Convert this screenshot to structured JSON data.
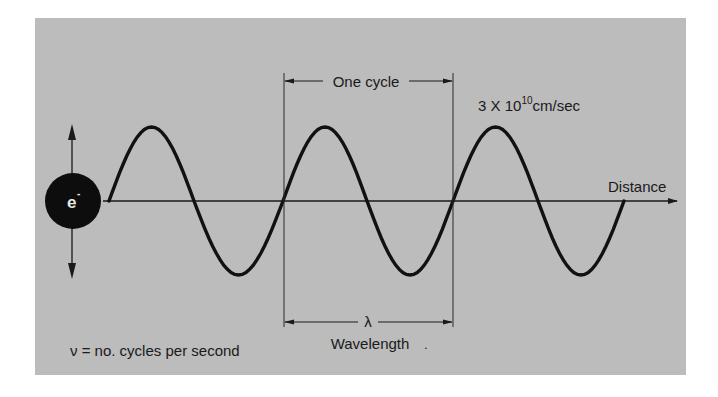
{
  "diagram": {
    "colors": {
      "background": "#bcbcbc",
      "ink": "#1a1a1a",
      "page": "#ffffff"
    },
    "electron": {
      "label": "e",
      "charge": "-",
      "cx": 73,
      "cy": 201,
      "r": 28
    },
    "oscillation_arrow": {
      "x": 72,
      "top": 124,
      "bottom": 279
    },
    "axis": {
      "y": 201,
      "x_start": 103,
      "x_end": 677,
      "label": "Distance"
    },
    "wave": {
      "amplitude": 74,
      "zero_crossings_x": [
        109,
        194,
        283,
        367,
        453,
        538,
        624
      ],
      "start_direction": "up",
      "cycles": 3
    },
    "cycle_markers": {
      "left_x": 284,
      "right_x": 453,
      "top_y": 73,
      "bottom_y": 327
    },
    "labels": {
      "one_cycle": "One cycle",
      "speed_base": "3 X 10",
      "speed_exponent": "10",
      "speed_unit": "cm/sec",
      "lambda": "λ",
      "wavelength": "Wavelength",
      "wavelength_mark": ".",
      "frequency_def": "ν = no. cycles per second"
    }
  }
}
